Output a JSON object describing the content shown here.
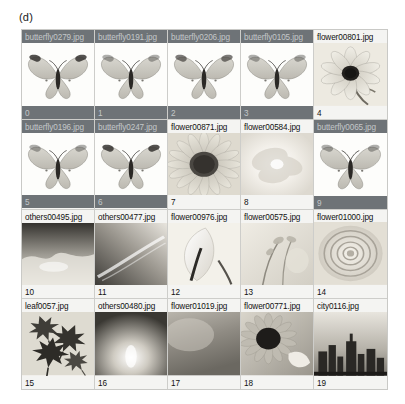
{
  "figure": {
    "caption": "(d)",
    "columns": 5,
    "rows": 4,
    "selected_color": "#6e7377",
    "selected_text_color": "#c3c7c9",
    "unselected_color": "#f4f4f2",
    "unselected_text_color": "#111111",
    "panel_background": "#f2f2f0"
  },
  "cells": [
    {
      "index": "0",
      "filename": "butterfly0279.jpg",
      "selected": true,
      "category": "butterfly"
    },
    {
      "index": "1",
      "filename": "butterfly0191.jpg",
      "selected": true,
      "category": "butterfly"
    },
    {
      "index": "2",
      "filename": "butterfly0206.jpg",
      "selected": true,
      "category": "butterfly"
    },
    {
      "index": "3",
      "filename": "butterfly0105.jpg",
      "selected": true,
      "category": "butterfly"
    },
    {
      "index": "4",
      "filename": "flower00801.jpg",
      "selected": false,
      "category": "flower"
    },
    {
      "index": "5",
      "filename": "butterfly0196.jpg",
      "selected": true,
      "category": "butterfly"
    },
    {
      "index": "6",
      "filename": "butterfly0247.jpg",
      "selected": true,
      "category": "butterfly"
    },
    {
      "index": "7",
      "filename": "flower00871.jpg",
      "selected": false,
      "category": "flower"
    },
    {
      "index": "8",
      "filename": "flower00584.jpg",
      "selected": false,
      "category": "flower"
    },
    {
      "index": "9",
      "filename": "butterfly0065.jpg",
      "selected": true,
      "category": "butterfly"
    },
    {
      "index": "10",
      "filename": "others00495.jpg",
      "selected": false,
      "category": "others"
    },
    {
      "index": "11",
      "filename": "others00477.jpg",
      "selected": false,
      "category": "others"
    },
    {
      "index": "12",
      "filename": "flower00976.jpg",
      "selected": false,
      "category": "flower"
    },
    {
      "index": "13",
      "filename": "flower00575.jpg",
      "selected": false,
      "category": "flower"
    },
    {
      "index": "14",
      "filename": "flower01000.jpg",
      "selected": false,
      "category": "flower"
    },
    {
      "index": "15",
      "filename": "leaf0057.jpg",
      "selected": false,
      "category": "leaf"
    },
    {
      "index": "16",
      "filename": "others00480.jpg",
      "selected": false,
      "category": "others"
    },
    {
      "index": "17",
      "filename": "flower01019.jpg",
      "selected": false,
      "category": "flower"
    },
    {
      "index": "18",
      "filename": "flower00771.jpg",
      "selected": false,
      "category": "flower"
    },
    {
      "index": "19",
      "filename": "city0116.jpg",
      "selected": false,
      "category": "city"
    }
  ]
}
